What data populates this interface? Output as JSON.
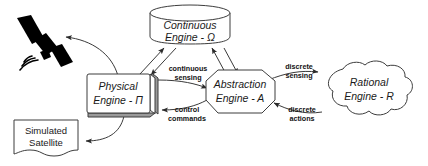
{
  "diagram": {
    "background_color": "#ffffff",
    "stroke_color": "#3d3d3d",
    "text_color": "#1a1a1a",
    "nodes": [
      {
        "id": "satellite",
        "shape": "icon",
        "icon": "satellite-icon",
        "label": ""
      },
      {
        "id": "continuous_engine",
        "shape": "cylinder",
        "line1": "Continuous",
        "line2": "Engine - Ω"
      },
      {
        "id": "physical_engine",
        "shape": "stacked-rect",
        "line1": "Physical",
        "line2": "Engine - Π"
      },
      {
        "id": "abstraction_engine",
        "shape": "octagon",
        "line1": "Abstraction",
        "line2": "Engine - A"
      },
      {
        "id": "rational_engine",
        "shape": "cloud",
        "line1": "Rational",
        "line2": "Engine - R"
      },
      {
        "id": "simulated_satellite",
        "shape": "document",
        "line1": "Simulated",
        "line2": "Satellite"
      }
    ],
    "edge_labels": {
      "continuous_sensing_line1": "continuous",
      "continuous_sensing_line2": "sensing",
      "control_commands_line1": "control",
      "control_commands_line2": "commands",
      "discrete_sensing_line1": "discrete",
      "discrete_sensing_line2": "sensing",
      "discrete_actions_line1": "discrete",
      "discrete_actions_line2": "actions"
    }
  }
}
